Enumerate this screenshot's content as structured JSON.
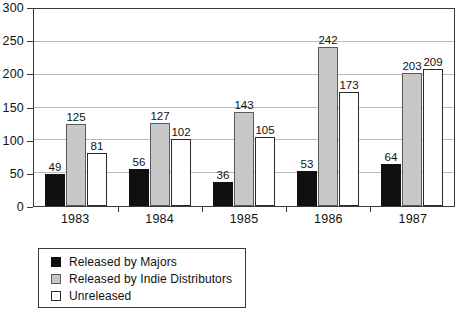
{
  "chart_data": {
    "type": "bar",
    "title": "",
    "subtitle": "",
    "xlabel": "",
    "ylabel": "",
    "categories": [
      "1983",
      "1984",
      "1985",
      "1986",
      "1987"
    ],
    "series": [
      {
        "name": "Released by Majors",
        "color": "#101010",
        "values": [
          49,
          56,
          36,
          53,
          64
        ]
      },
      {
        "name": "Released by Indie Distributors",
        "color": "#c8c8c8",
        "values": [
          125,
          127,
          143,
          242,
          203
        ]
      },
      {
        "name": "Unreleased",
        "color": "#ffffff",
        "values": [
          81,
          102,
          105,
          173,
          209
        ]
      }
    ],
    "ylim": [
      0,
      300
    ],
    "yticks": [
      0,
      50,
      100,
      150,
      200,
      250,
      300
    ],
    "ytick_labels": [
      "0",
      "50",
      "100",
      "150",
      "200",
      "250",
      "300"
    ],
    "grid": true,
    "grid_axis": "y",
    "legend_position": "below-left",
    "data_labels": true,
    "annotations": []
  },
  "colors": {
    "majors": "#101010",
    "indie": "#c8c8c8",
    "unreleased": "#ffffff",
    "axis": "#3a3a3a",
    "grid": "#b9b9b9",
    "background": "#ffffff"
  }
}
